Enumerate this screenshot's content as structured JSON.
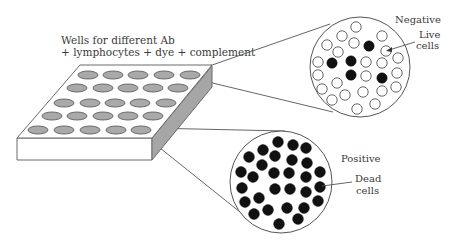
{
  "labels": {
    "wells_line1": "Wells for different Ab",
    "wells_line2": "+ lymphocytes + dye + complement",
    "negative": "Negative",
    "live_line1": "Live",
    "live_line2": "cells",
    "positive": "Positive",
    "dead_line1": "Dead",
    "dead_line2": "cells"
  },
  "colors": {
    "well_fill": "#a9a9a9",
    "plate_side": "#a6a6a6",
    "live_cell": "#ffffff",
    "dead_cell": "#111111",
    "line": "#555555"
  },
  "plate": {
    "rows": 5,
    "cols": 5,
    "wells": [
      [
        [
          88,
          75
        ],
        [
          113,
          75
        ],
        [
          138,
          75
        ],
        [
          164,
          75
        ],
        [
          190,
          75
        ]
      ],
      [
        [
          77,
          88
        ],
        [
          103,
          88
        ],
        [
          128,
          88
        ],
        [
          153,
          88
        ],
        [
          178,
          88
        ]
      ],
      [
        [
          64,
          103
        ],
        [
          90,
          103
        ],
        [
          115,
          103
        ],
        [
          140,
          103
        ],
        [
          166,
          103
        ]
      ],
      [
        [
          52,
          116
        ],
        [
          77,
          116
        ],
        [
          103,
          116
        ],
        [
          128,
          116
        ],
        [
          153,
          116
        ]
      ],
      [
        [
          38,
          130
        ],
        [
          64,
          130
        ],
        [
          90,
          130
        ],
        [
          116,
          130
        ],
        [
          141,
          130
        ]
      ]
    ]
  },
  "negative_view": {
    "center": [
      360,
      67
    ],
    "radius": 50,
    "cells": [
      {
        "x": 356,
        "y": 27,
        "state": "live"
      },
      {
        "x": 342,
        "y": 36,
        "state": "live"
      },
      {
        "x": 382,
        "y": 36,
        "state": "live"
      },
      {
        "x": 327,
        "y": 45,
        "state": "live"
      },
      {
        "x": 354,
        "y": 43,
        "state": "live"
      },
      {
        "x": 369,
        "y": 46,
        "state": "dead"
      },
      {
        "x": 386,
        "y": 51,
        "state": "live",
        "highlight": true
      },
      {
        "x": 338,
        "y": 52,
        "state": "live"
      },
      {
        "x": 398,
        "y": 58,
        "state": "live"
      },
      {
        "x": 318,
        "y": 62,
        "state": "live"
      },
      {
        "x": 332,
        "y": 63,
        "state": "dead"
      },
      {
        "x": 351,
        "y": 61,
        "state": "dead"
      },
      {
        "x": 366,
        "y": 62,
        "state": "live"
      },
      {
        "x": 382,
        "y": 63,
        "state": "live"
      },
      {
        "x": 318,
        "y": 75,
        "state": "live"
      },
      {
        "x": 351,
        "y": 75,
        "state": "dead"
      },
      {
        "x": 366,
        "y": 76,
        "state": "live"
      },
      {
        "x": 382,
        "y": 78,
        "state": "dead"
      },
      {
        "x": 397,
        "y": 73,
        "state": "live"
      },
      {
        "x": 337,
        "y": 83,
        "state": "live"
      },
      {
        "x": 322,
        "y": 89,
        "state": "live"
      },
      {
        "x": 345,
        "y": 95,
        "state": "live"
      },
      {
        "x": 363,
        "y": 92,
        "state": "live"
      },
      {
        "x": 382,
        "y": 91,
        "state": "live"
      },
      {
        "x": 396,
        "y": 87,
        "state": "live"
      },
      {
        "x": 332,
        "y": 100,
        "state": "live"
      },
      {
        "x": 357,
        "y": 109,
        "state": "live"
      },
      {
        "x": 375,
        "y": 104,
        "state": "live"
      }
    ]
  },
  "positive_view": {
    "center": [
      281,
      182
    ],
    "radius": 51,
    "cells": [
      {
        "x": 278,
        "y": 142
      },
      {
        "x": 263,
        "y": 150
      },
      {
        "x": 293,
        "y": 145
      },
      {
        "x": 306,
        "y": 148
      },
      {
        "x": 249,
        "y": 157
      },
      {
        "x": 275,
        "y": 156
      },
      {
        "x": 292,
        "y": 160
      },
      {
        "x": 262,
        "y": 165
      },
      {
        "x": 307,
        "y": 163
      },
      {
        "x": 241,
        "y": 172
      },
      {
        "x": 253,
        "y": 177
      },
      {
        "x": 274,
        "y": 173
      },
      {
        "x": 289,
        "y": 173
      },
      {
        "x": 306,
        "y": 177
      },
      {
        "x": 320,
        "y": 172
      },
      {
        "x": 242,
        "y": 188
      },
      {
        "x": 275,
        "y": 189
      },
      {
        "x": 290,
        "y": 189
      },
      {
        "x": 306,
        "y": 192
      },
      {
        "x": 320,
        "y": 187
      },
      {
        "x": 259,
        "y": 198
      },
      {
        "x": 245,
        "y": 202
      },
      {
        "x": 268,
        "y": 210
      },
      {
        "x": 287,
        "y": 208
      },
      {
        "x": 304,
        "y": 208
      },
      {
        "x": 318,
        "y": 201
      },
      {
        "x": 254,
        "y": 214
      },
      {
        "x": 298,
        "y": 219
      },
      {
        "x": 279,
        "y": 224
      }
    ]
  }
}
